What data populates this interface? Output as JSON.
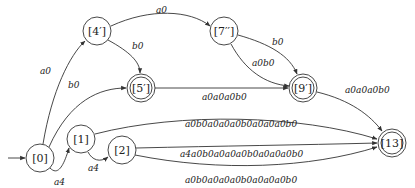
{
  "diagram": {
    "type": "finite-automaton",
    "nodes": [
      {
        "id": "n0",
        "label": "[0]",
        "x": 40,
        "y": 158,
        "accepting": false,
        "initial": true
      },
      {
        "id": "n1",
        "label": "[1]",
        "x": 81,
        "y": 139,
        "accepting": false
      },
      {
        "id": "n2",
        "label": "[2]",
        "x": 122,
        "y": 150,
        "accepting": false
      },
      {
        "id": "n4p",
        "label": "[4′]",
        "x": 97,
        "y": 31,
        "accepting": false
      },
      {
        "id": "n5p",
        "label": "[5′]",
        "x": 141,
        "y": 88,
        "accepting": true
      },
      {
        "id": "n7pp",
        "label": "[7′′]",
        "x": 224,
        "y": 31,
        "accepting": false
      },
      {
        "id": "n9p",
        "label": "[9′]",
        "x": 303,
        "y": 88,
        "accepting": true
      },
      {
        "id": "n13",
        "label": "[13]",
        "x": 392,
        "y": 143,
        "accepting": true
      }
    ],
    "edges": [
      {
        "from": "[0]",
        "to": "[4′]",
        "label": "a0"
      },
      {
        "from": "[0]",
        "to": "[5′]",
        "label": "b0"
      },
      {
        "from": "[0]",
        "to": "[1]",
        "label": "a4"
      },
      {
        "from": "[1]",
        "to": "[2]",
        "label": "a4"
      },
      {
        "from": "[4′]",
        "to": "[7′′]",
        "label": "a0"
      },
      {
        "from": "[4′]",
        "to": "[5′]",
        "label": "b0"
      },
      {
        "from": "[5′]",
        "to": "[9′]",
        "label": "a0a0a0b0"
      },
      {
        "from": "[7′′]",
        "to": "[9′]",
        "label": "b0"
      },
      {
        "from": "[7′′]",
        "to": "[9′]",
        "label": "a0b0"
      },
      {
        "from": "[9′]",
        "to": "[13]",
        "label": "a0a0a0b0"
      },
      {
        "from": "[1]",
        "to": "[13]",
        "label": "a0b0a0a0a0b0a0a0a0b0"
      },
      {
        "from": "[2]",
        "to": "[13]",
        "label": "a4a0b0a0a0a0b0a0a0a0b0"
      },
      {
        "from": "[2]",
        "to": "[13]",
        "label": "a0b0a0a0a0b0a0a0a0b0"
      }
    ]
  }
}
